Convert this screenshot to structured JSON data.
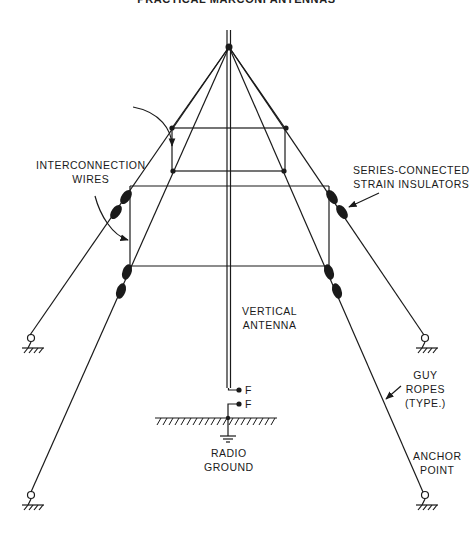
{
  "header": {
    "title": "PRACTICAL MARCONI ANTENNAS"
  },
  "labels": {
    "interconnection_wires": [
      "INTERCONNECTION",
      "WIRES"
    ],
    "insulators": [
      "SERIES-CONNECTED",
      "STRAIN INSULATORS"
    ],
    "vertical_antenna": [
      "VERTICAL",
      "ANTENNA"
    ],
    "feed_top": "F",
    "feed_bottom": "F",
    "radio_ground": [
      "RADIO",
      "GROUND"
    ],
    "guy_ropes": [
      "GUY",
      "ROPES",
      "(TYPE.)"
    ],
    "anchor_point": [
      "ANCHOR",
      "POINT"
    ]
  },
  "colors": {
    "ink": "#1a1a1a",
    "background": "#ffffff"
  }
}
